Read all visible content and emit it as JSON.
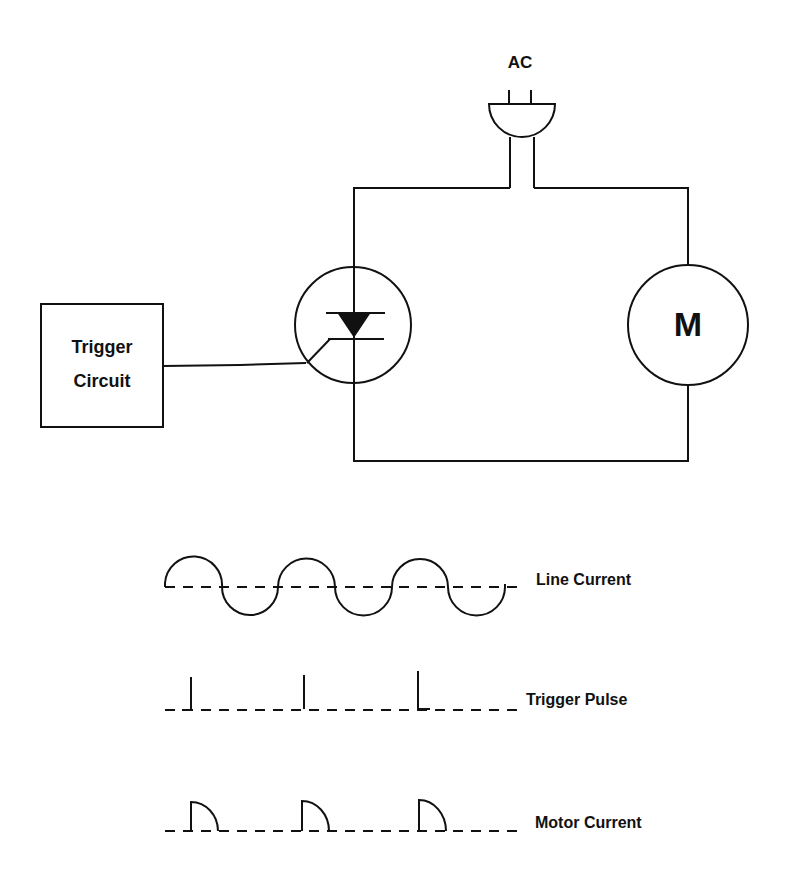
{
  "source": {
    "label": "AC"
  },
  "trigger_circuit": {
    "line1": "Trigger",
    "line2": "Circuit"
  },
  "motor": {
    "symbol": "M"
  },
  "scr": {
    "symbol": "thyristor-icon"
  },
  "waveforms": [
    {
      "id": "line-current",
      "label": "Line Current",
      "shape": "sine-wave"
    },
    {
      "id": "trigger-pulse",
      "label": "Trigger Pulse",
      "shape": "pulse-train"
    },
    {
      "id": "motor-current",
      "label": "Motor Current",
      "shape": "partial-half-wave"
    }
  ],
  "colors": {
    "line": "#111111",
    "background": "#ffffff"
  }
}
